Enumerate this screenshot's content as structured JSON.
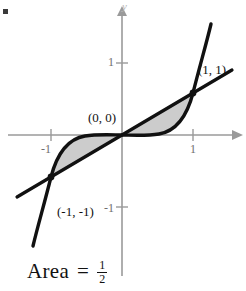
{
  "figure": {
    "name": "area-between-line-and-cubic",
    "background": "#ffffff",
    "axis_color": "#9a9a9a",
    "curve_color": "#111111",
    "shade_color": "#cccccc",
    "axes": {
      "x_label": "",
      "y_label": "y",
      "x_ticks": [
        {
          "value": "-1",
          "label": "-1"
        },
        {
          "value": "1",
          "label": "1"
        }
      ],
      "y_ticks": [
        {
          "value": "1",
          "label": "1"
        },
        {
          "value": "-1",
          "label": "-1"
        }
      ],
      "xlim": [
        -1.75,
        1.9
      ],
      "ylim": [
        -1.9,
        1.75
      ]
    },
    "points": [
      {
        "name": "upper-intersection",
        "label": "(1, 1)",
        "x": 1,
        "y": 1
      },
      {
        "name": "origin-intersection",
        "label": "(0, 0)",
        "x": 0,
        "y": 0
      },
      {
        "name": "lower-intersection",
        "label": "(-1, -1)",
        "x": -1,
        "y": -1
      }
    ],
    "curves": [
      {
        "name": "line-y-equals-x",
        "equation": "y = x"
      },
      {
        "name": "cubic-y-equals-x-cubed",
        "equation": "y = x^3"
      }
    ],
    "shaded_regions": [
      {
        "name": "region-quadrant-one",
        "between": "y = x and y = x^3",
        "interval": "0 to 1"
      },
      {
        "name": "region-quadrant-three",
        "between": "y = x^3 and y = x",
        "interval": "-1 to 0"
      }
    ]
  },
  "caption": {
    "prefix": "Area",
    "equals": "=",
    "numerator": "1",
    "denominator": "2"
  }
}
